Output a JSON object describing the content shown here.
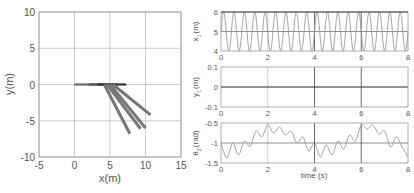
{
  "chart_data": [
    {
      "type": "line",
      "title": "",
      "xlabel": "x(m)",
      "ylabel": "y(m)",
      "xlim": [
        -5,
        15
      ],
      "ylim": [
        -10,
        10
      ],
      "xticks": [
        -5,
        0,
        5,
        10,
        15
      ],
      "yticks": [
        -10,
        -5,
        0,
        5,
        10
      ],
      "grid": true,
      "description": "Snapshots of a cart (horizontal bar at y=0) with a hanging pendulum link",
      "cart_segments": [
        {
          "x0": 0,
          "x1": 4,
          "y": 0,
          "color": "#666666"
        },
        {
          "x0": 2,
          "x1": 6,
          "y": 0,
          "color": "#555555"
        },
        {
          "x0": 3.3,
          "x1": 7.3,
          "y": 0,
          "color": "#333333"
        }
      ],
      "pendulum_links": [
        {
          "x0": 4.2,
          "y0": 0,
          "x1": 7.8,
          "y1": -6.8
        },
        {
          "x0": 4.6,
          "y0": 0,
          "x1": 9.3,
          "y1": -6.1
        },
        {
          "x0": 5.0,
          "y0": 0,
          "x1": 10.0,
          "y1": -6.0
        },
        {
          "x0": 5.4,
          "y0": 0,
          "x1": 10.7,
          "y1": -4.2
        }
      ]
    },
    {
      "type": "line",
      "xlabel": "",
      "ylabel": "x1(m)",
      "xlim": [
        0,
        8
      ],
      "ylim": [
        4,
        6
      ],
      "xticks": [
        0,
        2,
        4,
        6,
        8
      ],
      "yticks": [
        4,
        5,
        6
      ],
      "grid": true,
      "series": [
        {
          "name": "x1",
          "function": "5 + sin(2*pi*2.25*t)",
          "amplitude": 1,
          "mean": 5,
          "frequency_hz": 2.25
        }
      ]
    },
    {
      "type": "line",
      "xlabel": "",
      "ylabel": "y1(m)",
      "xlim": [
        0,
        8
      ],
      "ylim": [
        -0.1,
        0.1
      ],
      "xticks": [
        0,
        2,
        4,
        6,
        8
      ],
      "yticks": [
        -0.1,
        0,
        0.1
      ],
      "grid": true,
      "series": [
        {
          "name": "y1",
          "x": [
            0,
            8
          ],
          "values": [
            0,
            0
          ]
        }
      ]
    },
    {
      "type": "line",
      "xlabel": "time (s)",
      "ylabel": "θ2 (rad)",
      "xlim": [
        0,
        8
      ],
      "ylim": [
        -1.5,
        -0.5
      ],
      "xticks": [
        0,
        2,
        4,
        6,
        8
      ],
      "yticks": [
        -1.5,
        -1,
        -0.5
      ],
      "grid": true,
      "series": [
        {
          "name": "theta2",
          "x": [
            0,
            0.25,
            0.5,
            0.75,
            1.0,
            1.25,
            1.5,
            1.75,
            2.0,
            2.25,
            2.5,
            2.75,
            3.0,
            3.25,
            3.5,
            3.75,
            4.0,
            4.25,
            4.5,
            4.75,
            5.0,
            5.25,
            5.5,
            5.75,
            6.0,
            6.25,
            6.5,
            6.75,
            7.0,
            7.25,
            7.5,
            7.75,
            8.0
          ],
          "values": [
            -1.0,
            -1.38,
            -1.0,
            -1.3,
            -0.95,
            -1.08,
            -0.7,
            -0.85,
            -0.55,
            -0.75,
            -0.6,
            -0.8,
            -0.7,
            -1.0,
            -0.85,
            -1.2,
            -1.0,
            -1.35,
            -1.05,
            -1.3,
            -0.95,
            -1.15,
            -0.8,
            -0.95,
            -0.55,
            -0.65,
            -0.55,
            -0.78,
            -0.7,
            -1.1,
            -0.85,
            -1.1,
            -1.35
          ]
        }
      ]
    }
  ],
  "labels": {
    "left": {
      "xlabel": "x(m)",
      "ylabel": "y(m)",
      "xticks": [
        "-5",
        "0",
        "5",
        "10",
        "15"
      ],
      "yticks": [
        "10",
        "5",
        "0",
        "-5",
        "-10"
      ]
    },
    "p1": {
      "ylabel_main": "x",
      "ylabel_sub": "1",
      "ylabel_unit": "(m)",
      "yticks": [
        "6",
        "5",
        "4"
      ]
    },
    "p2": {
      "ylabel_main": "y",
      "ylabel_sub": "1",
      "ylabel_unit": "(m)",
      "yticks": [
        "0.1",
        "0",
        "-0.1"
      ]
    },
    "p3": {
      "ylabel_main": "θ",
      "ylabel_sub": "2",
      "ylabel_unit": "(rad)",
      "yticks": [
        "-0.5",
        "-1",
        "-1.5"
      ]
    },
    "time_ticks": [
      "0",
      "2",
      "4",
      "6",
      "8"
    ],
    "time_xlabel": "time (s)"
  },
  "colors": {
    "axis": "#888888",
    "grid": "#aaaaaa",
    "dark_grid": "#444444",
    "curve": "#999999",
    "link": "#777777",
    "cart_dark": "#333333"
  }
}
